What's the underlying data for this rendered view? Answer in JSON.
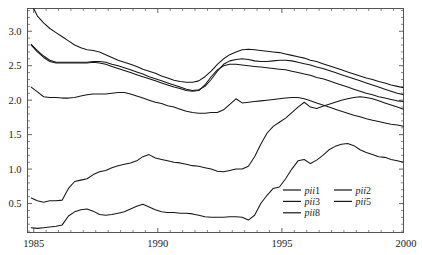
{
  "chart_data": {
    "type": "line",
    "title": "",
    "subtitle": "",
    "xlabel": "",
    "ylabel": "",
    "xlim": [
      1984.75,
      1999.9
    ],
    "ylim": [
      0.08,
      3.33
    ],
    "grid": false,
    "legend_position": "bottom-right",
    "x_ticks": [
      1985,
      1990,
      1995,
      2000
    ],
    "x_tick_labels": [
      "1985",
      "1990",
      "1995",
      "2000"
    ],
    "x_minor_step": 0.5,
    "y_ticks": [
      0.5,
      1.0,
      1.5,
      2.0,
      2.5,
      3.0
    ],
    "y_tick_labels": [
      "0.5",
      "1.0",
      "1.5",
      "2.0",
      "2.5",
      "3.0"
    ],
    "y_minor_step": 0.1,
    "x_start": 1984.9,
    "x_step": 0.25,
    "series": [
      {
        "name": "pii1",
        "label_italic": "pii",
        "label_upright": "1",
        "color": "#161616",
        "values": [
          3.4,
          3.22,
          3.12,
          3.04,
          2.98,
          2.92,
          2.86,
          2.8,
          2.76,
          2.73,
          2.72,
          2.7,
          2.66,
          2.62,
          2.58,
          2.55,
          2.52,
          2.49,
          2.45,
          2.42,
          2.39,
          2.35,
          2.32,
          2.29,
          2.27,
          2.26,
          2.26,
          2.28,
          2.34,
          2.42,
          2.52,
          2.6,
          2.66,
          2.7,
          2.73,
          2.74,
          2.73,
          2.72,
          2.71,
          2.7,
          2.69,
          2.67,
          2.65,
          2.63,
          2.61,
          2.58,
          2.56,
          2.53,
          2.5,
          2.47,
          2.44,
          2.41,
          2.38,
          2.35,
          2.32,
          2.3,
          2.27,
          2.25,
          2.22,
          2.2,
          2.18,
          2.16
        ]
      },
      {
        "name": "pii2",
        "label_italic": "pii",
        "label_upright": "2",
        "color": "#161616",
        "values": [
          2.81,
          2.72,
          2.64,
          2.58,
          2.55,
          2.55,
          2.55,
          2.55,
          2.55,
          2.55,
          2.56,
          2.56,
          2.55,
          2.52,
          2.5,
          2.47,
          2.44,
          2.41,
          2.38,
          2.34,
          2.31,
          2.28,
          2.25,
          2.22,
          2.19,
          2.16,
          2.14,
          2.15,
          2.2,
          2.3,
          2.42,
          2.52,
          2.57,
          2.59,
          2.6,
          2.59,
          2.57,
          2.56,
          2.56,
          2.57,
          2.58,
          2.58,
          2.57,
          2.55,
          2.53,
          2.51,
          2.48,
          2.46,
          2.43,
          2.4,
          2.37,
          2.34,
          2.31,
          2.28,
          2.25,
          2.22,
          2.19,
          2.16,
          2.13,
          2.1,
          2.08,
          2.06
        ]
      },
      {
        "name": "pii3",
        "label_italic": "pii",
        "label_upright": "3",
        "color": "#161616",
        "values": [
          2.8,
          2.7,
          2.62,
          2.56,
          2.54,
          2.54,
          2.54,
          2.54,
          2.54,
          2.54,
          2.55,
          2.54,
          2.52,
          2.49,
          2.46,
          2.43,
          2.4,
          2.37,
          2.34,
          2.31,
          2.28,
          2.25,
          2.22,
          2.19,
          2.17,
          2.14,
          2.13,
          2.14,
          2.22,
          2.34,
          2.44,
          2.5,
          2.52,
          2.52,
          2.51,
          2.5,
          2.49,
          2.48,
          2.47,
          2.46,
          2.45,
          2.44,
          2.42,
          2.4,
          2.38,
          2.36,
          2.33,
          2.31,
          2.28,
          2.25,
          2.22,
          2.19,
          2.16,
          2.13,
          2.1,
          2.08,
          2.05,
          2.03,
          2.01,
          1.99,
          1.98,
          1.97
        ]
      },
      {
        "name": "pii5",
        "label_italic": "pii",
        "label_upright": "5",
        "color": "#161616",
        "values": [
          2.19,
          2.12,
          2.05,
          2.04,
          2.04,
          2.03,
          2.03,
          2.04,
          2.06,
          2.08,
          2.09,
          2.09,
          2.09,
          2.1,
          2.11,
          2.11,
          2.09,
          2.06,
          2.03,
          2.0,
          1.97,
          1.95,
          1.92,
          1.9,
          1.87,
          1.84,
          1.82,
          1.81,
          1.81,
          1.82,
          1.82,
          1.86,
          1.94,
          2.02,
          1.96,
          1.97,
          1.98,
          1.99,
          2.0,
          2.01,
          2.02,
          2.03,
          2.04,
          2.04,
          2.02,
          1.99,
          1.96,
          1.93,
          1.9,
          1.87,
          1.84,
          1.81,
          1.78,
          1.76,
          1.73,
          1.71,
          1.69,
          1.67,
          1.65,
          1.64,
          1.62,
          1.61
        ]
      },
      {
        "name": "pii8",
        "label_italic": "pii",
        "label_upright": "8",
        "color": "#161616",
        "values": [
          0.58,
          0.54,
          0.52,
          0.54,
          0.54,
          0.55,
          0.72,
          0.82,
          0.84,
          0.86,
          0.92,
          0.96,
          0.98,
          1.02,
          1.05,
          1.07,
          1.09,
          1.12,
          1.18,
          1.21,
          1.16,
          1.14,
          1.12,
          1.1,
          1.09,
          1.07,
          1.05,
          1.04,
          1.02,
          1.0,
          0.97,
          0.96,
          0.98,
          1.0,
          1.0,
          1.04,
          1.18,
          1.36,
          1.52,
          1.62,
          1.68,
          1.74,
          1.82,
          1.9,
          1.97,
          1.9,
          1.88,
          1.91,
          1.94,
          1.97,
          2.0,
          2.02,
          2.04,
          2.05,
          2.04,
          2.02,
          1.99,
          1.96,
          1.93,
          1.9,
          1.87,
          1.84
        ]
      },
      {
        "name": "pii8-lower",
        "label_italic": "",
        "label_upright": "",
        "color": "#161616",
        "values": [
          0.15,
          0.14,
          0.15,
          0.16,
          0.17,
          0.19,
          0.32,
          0.38,
          0.41,
          0.42,
          0.39,
          0.34,
          0.33,
          0.34,
          0.36,
          0.38,
          0.42,
          0.46,
          0.49,
          0.45,
          0.41,
          0.38,
          0.37,
          0.37,
          0.36,
          0.36,
          0.35,
          0.33,
          0.31,
          0.3,
          0.3,
          0.3,
          0.31,
          0.31,
          0.3,
          0.26,
          0.33,
          0.5,
          0.62,
          0.72,
          0.74,
          0.86,
          1.0,
          1.12,
          1.14,
          1.08,
          1.13,
          1.2,
          1.28,
          1.33,
          1.36,
          1.37,
          1.34,
          1.28,
          1.24,
          1.21,
          1.18,
          1.17,
          1.14,
          1.12,
          1.1,
          1.08,
          1.06,
          1.05
        ]
      }
    ],
    "legend": {
      "columns": 2,
      "entries": [
        {
          "label_italic": "pii",
          "label_upright": "1",
          "column": 0,
          "row": 0
        },
        {
          "label_italic": "pii",
          "label_upright": "2",
          "column": 1,
          "row": 0
        },
        {
          "label_italic": "pii",
          "label_upright": "3",
          "column": 0,
          "row": 1
        },
        {
          "label_italic": "pii",
          "label_upright": "5",
          "column": 1,
          "row": 1
        },
        {
          "label_italic": "pii",
          "label_upright": "8",
          "column": 0,
          "row": 2
        }
      ]
    }
  },
  "axes": {
    "x_tick_labels": [
      "1985",
      "1990",
      "1995",
      "2000"
    ],
    "y_tick_labels": [
      "0.5",
      "1.0",
      "1.5",
      "2.0",
      "2.5",
      "3.0"
    ]
  }
}
